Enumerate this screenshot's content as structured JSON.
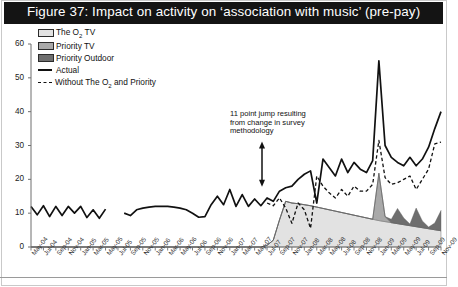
{
  "title": "Figure 37: Impact on activity on ‘association with music’ (pre-pay)",
  "colors": {
    "titlebar": "#141414",
    "title_text": "#ffffff",
    "o2_tv": "#e2e2e2",
    "priority_tv": "#a9a9a9",
    "priority_outdoor": "#6e6e6e",
    "actual_line": "#111111",
    "without_line": "#111111",
    "axis": "#6f6f6f"
  },
  "legend": {
    "position": "top-left",
    "items": [
      {
        "label": "The O2 TV",
        "label_main": "The O",
        "label_sub": "2",
        "label_tail": " TV",
        "type": "area",
        "swatch": "#e2e2e2",
        "name": "o2-tv"
      },
      {
        "label": "Priority TV",
        "type": "area",
        "swatch": "#a9a9a9",
        "name": "priority-tv"
      },
      {
        "label": "Priority Outdoor",
        "type": "area",
        "swatch": "#6e6e6e",
        "name": "priority-outdoor"
      },
      {
        "label": "Actual",
        "type": "line",
        "swatch": "#111111",
        "name": "actual"
      },
      {
        "label": "Without The O2 and Priority",
        "label_main": "Without The O",
        "label_sub": "2",
        "label_tail": " and Priority",
        "type": "dashed-line",
        "swatch": "#111111",
        "name": "without-o2-and-priority"
      }
    ]
  },
  "annotation": {
    "text": "11 point jump resulting from change in survey methodology",
    "arrow": "double-headed-vertical",
    "arrow_top_value": 30,
    "arrow_bottom_value": 19
  },
  "chart_data": {
    "type": "area",
    "title": "Figure 37: Impact on activity on ‘association with music’ (pre-pay)",
    "xlabel": "",
    "ylabel": "",
    "ylim": [
      0,
      60
    ],
    "yticks": [
      0,
      10,
      20,
      30,
      40,
      50,
      60
    ],
    "grid": false,
    "legend_position": "top-left",
    "x_tick_step_months": 2,
    "categories": [
      "May-04",
      "Jun-04",
      "Jul-04",
      "Aug-04",
      "Sep-04",
      "Oct-04",
      "Nov-04",
      "Dec-04",
      "Jan-05",
      "Feb-05",
      "Mar-05",
      "Apr-05",
      "May-05",
      "Jun-05",
      "Jul-05",
      "Aug-05",
      "Sep-05",
      "Oct-05",
      "Nov-05",
      "Dec-05",
      "Jan-06",
      "Feb-06",
      "Mar-06",
      "Apr-06",
      "May-06",
      "Jun-06",
      "Jul-06",
      "Aug-06",
      "Sep-06",
      "Oct-06",
      "Nov-06",
      "Dec-06",
      "Jan-07",
      "Feb-07",
      "Mar-07",
      "Apr-07",
      "May-07",
      "Jun-07",
      "Jul-07",
      "Aug-07",
      "Sep-07",
      "Oct-07",
      "Nov-07",
      "Dec-07",
      "Jan-08",
      "Feb-08",
      "Mar-08",
      "Apr-08",
      "May-08",
      "Jun-08",
      "Jul-08",
      "Aug-08",
      "Sep-08",
      "Oct-08",
      "Nov-08",
      "Dec-08",
      "Jan-09",
      "Feb-09",
      "Mar-09",
      "Apr-09",
      "May-09",
      "Jun-09",
      "Jul-09",
      "Aug-09",
      "Sep-09",
      "Oct-09",
      "Nov-09"
    ],
    "xticklabels": [
      "May-04",
      "Jul-04",
      "Sep-04",
      "Nov-04",
      "Jan-05",
      "Mar-05",
      "May-05",
      "Jul-05",
      "Sep-05",
      "Nov-05",
      "Jan-06",
      "Mar-06",
      "May-06",
      "Jul-06",
      "Sep-06",
      "Nov-06",
      "Jan-07",
      "Mar-07",
      "May-07",
      "Jul-07",
      "Sep-07",
      "Nov-07",
      "Jan-08",
      "Mar-08",
      "May-08",
      "Jul-08",
      "Sep-08",
      "Nov-08",
      "Jan-09",
      "Mar-09",
      "May-09",
      "Jul-09",
      "Sep-09",
      "Nov-09"
    ],
    "series": [
      {
        "name": "Actual",
        "kind": "line",
        "style": "solid",
        "color": "#111111",
        "gaps": [
          13,
          14
        ],
        "values": [
          12.0,
          9.5,
          12.2,
          9.0,
          12.0,
          9.3,
          12.0,
          10.0,
          12.0,
          8.7,
          11.0,
          8.5,
          11.2,
          null,
          null,
          10.0,
          9.3,
          11.0,
          11.5,
          11.8,
          12.0,
          12.0,
          12.0,
          11.8,
          11.5,
          11.0,
          10.0,
          8.8,
          9.0,
          12.5,
          15.0,
          12.5,
          17.0,
          12.0,
          15.5,
          12.0,
          14.2,
          12.2,
          14.5,
          13.5,
          16.5,
          17.5,
          18.0,
          20.0,
          21.5,
          22.5,
          13.0,
          26.0,
          23.5,
          21.0,
          26.0,
          22.0,
          25.0,
          23.0,
          22.0,
          25.5,
          55.0,
          30.0,
          26.5,
          25.0,
          24.0,
          26.5,
          24.0,
          26.0,
          29.5,
          35.0,
          40.0
        ]
      },
      {
        "name": "Without The O2 and Priority",
        "kind": "line",
        "style": "dashed",
        "color": "#111111",
        "start_index": 38,
        "values": [
          null,
          null,
          null,
          null,
          null,
          null,
          null,
          null,
          null,
          null,
          null,
          null,
          null,
          null,
          null,
          null,
          null,
          null,
          null,
          null,
          null,
          null,
          null,
          null,
          null,
          null,
          null,
          null,
          null,
          null,
          null,
          null,
          null,
          null,
          null,
          null,
          null,
          null,
          13.0,
          12.2,
          14.5,
          11.5,
          7.0,
          13.0,
          11.0,
          5.5,
          21.0,
          18.0,
          16.0,
          14.5,
          17.0,
          15.0,
          18.0,
          16.5,
          16.5,
          18.5,
          31.5,
          20.5,
          18.5,
          19.0,
          20.0,
          21.0,
          17.0,
          20.0,
          23.0,
          30.5,
          31.0
        ]
      },
      {
        "name": "The O2 TV",
        "kind": "area",
        "stack": 1,
        "color": "#e2e2e2",
        "values": [
          0,
          0,
          0,
          0,
          0,
          0,
          0,
          0,
          0,
          0,
          0,
          0,
          0,
          0,
          0,
          0,
          0,
          0,
          0,
          0,
          0,
          0,
          0,
          0,
          0,
          0,
          0,
          0,
          0,
          0,
          0,
          0,
          0,
          0,
          0,
          0,
          0,
          0,
          0.5,
          2.0,
          8.0,
          13.5,
          13.0,
          12.8,
          12.5,
          12.2,
          11.8,
          11.4,
          11.0,
          10.6,
          10.2,
          9.8,
          9.4,
          9.0,
          8.6,
          8.2,
          7.8,
          7.5,
          7.2,
          6.9,
          6.6,
          6.3,
          6.0,
          5.7,
          5.4,
          5.1,
          4.8
        ]
      },
      {
        "name": "Priority TV",
        "kind": "area",
        "stack": 2,
        "color": "#a9a9a9",
        "values": [
          0,
          0,
          0,
          0,
          0,
          0,
          0,
          0,
          0,
          0,
          0,
          0,
          0,
          0,
          0,
          0,
          0,
          0,
          0,
          0,
          0,
          0,
          0,
          0,
          0,
          0,
          0,
          0,
          0,
          0,
          0,
          0,
          0,
          0,
          0,
          0,
          0,
          0,
          0,
          0,
          0,
          0,
          0,
          0,
          0,
          0,
          0,
          0,
          0,
          0,
          0,
          0,
          0,
          0,
          0,
          0,
          14.0,
          1.5,
          0,
          0,
          0,
          0,
          0,
          0,
          0,
          0,
          0
        ]
      },
      {
        "name": "Priority Outdoor",
        "kind": "area",
        "stack": 3,
        "color": "#6e6e6e",
        "values": [
          0,
          0,
          0,
          0,
          0,
          0,
          0,
          0,
          0,
          0,
          0,
          0,
          0,
          0,
          0,
          0,
          0,
          0,
          0,
          0,
          0,
          0,
          0,
          0,
          0,
          0,
          0,
          0,
          0,
          0,
          0,
          0,
          0,
          0,
          0,
          0,
          0,
          0,
          0,
          0,
          0,
          0,
          0,
          0,
          0,
          0,
          0,
          0,
          0,
          0,
          0,
          0,
          0,
          0,
          0,
          0,
          0,
          0,
          1.0,
          4.5,
          2.0,
          0.5,
          5.5,
          2.0,
          0.5,
          2.0,
          6.0
        ]
      }
    ]
  }
}
